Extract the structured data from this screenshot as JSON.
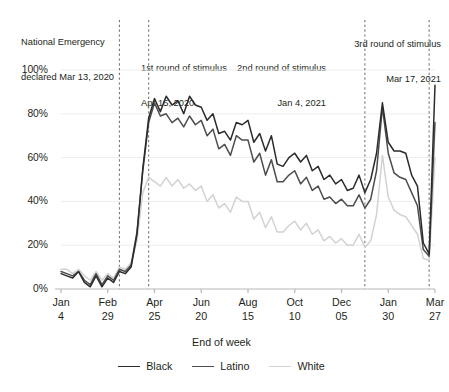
{
  "chart_data": {
    "type": "line",
    "title": "",
    "xlabel": "End of week",
    "ylabel": "",
    "ylim": [
      0,
      100
    ],
    "ytick_labels": [
      "100%",
      "80%",
      "60%",
      "40%",
      "20%",
      "0%"
    ],
    "ytick_values": [
      100,
      80,
      60,
      40,
      20,
      0
    ],
    "grid": true,
    "legend_position": "bottom",
    "xtick_labels": [
      {
        "month": "Jan",
        "day": "4"
      },
      {
        "month": "Feb",
        "day": "29"
      },
      {
        "month": "Apr",
        "day": "25"
      },
      {
        "month": "Jun",
        "day": "20"
      },
      {
        "month": "Aug",
        "day": "15"
      },
      {
        "month": "Oct",
        "day": "10"
      },
      {
        "month": "Dec",
        "day": "05"
      },
      {
        "month": "Jan",
        "day": "30"
      },
      {
        "month": "Mar",
        "day": "27"
      }
    ],
    "xtick_index": [
      0,
      8,
      16,
      24,
      32,
      40,
      48,
      56,
      64
    ],
    "x_count": 65,
    "series": [
      {
        "name": "Black",
        "color": "#2b2b2b",
        "values": [
          7,
          6,
          5,
          8,
          3,
          1,
          6,
          1,
          5,
          3,
          8,
          7,
          10,
          25,
          55,
          78,
          87,
          81,
          88,
          84,
          86,
          80,
          88,
          84,
          83,
          77,
          80,
          71,
          72,
          68,
          76,
          75,
          77,
          67,
          71,
          63,
          70,
          57,
          56,
          60,
          62,
          58,
          61,
          54,
          56,
          50,
          52,
          48,
          50,
          45,
          46,
          52,
          44,
          50,
          62,
          85,
          67,
          63,
          63,
          62,
          52,
          47,
          21,
          16,
          93
        ]
      },
      {
        "name": "Latino",
        "color": "#4d4d4d",
        "values": [
          8,
          7,
          6,
          8,
          4,
          2,
          7,
          2,
          6,
          4,
          9,
          8,
          11,
          26,
          54,
          76,
          85,
          79,
          80,
          76,
          78,
          74,
          79,
          75,
          77,
          70,
          73,
          64,
          66,
          61,
          70,
          68,
          68,
          58,
          62,
          52,
          59,
          49,
          49,
          52,
          54,
          48,
          51,
          45,
          47,
          41,
          42,
          39,
          41,
          38,
          38,
          43,
          37,
          41,
          54,
          83,
          62,
          53,
          51,
          50,
          44,
          38,
          18,
          15,
          76
        ]
      },
      {
        "name": "White",
        "color": "#d2d2d2",
        "values": [
          9,
          9,
          7,
          9,
          6,
          4,
          8,
          4,
          7,
          5,
          10,
          9,
          12,
          22,
          44,
          51,
          49,
          47,
          51,
          47,
          50,
          46,
          48,
          45,
          47,
          40,
          43,
          37,
          39,
          35,
          42,
          40,
          40,
          32,
          35,
          28,
          33,
          26,
          26,
          29,
          31,
          27,
          30,
          25,
          27,
          22,
          24,
          21,
          23,
          20,
          20,
          25,
          19,
          22,
          34,
          61,
          42,
          36,
          34,
          33,
          29,
          25,
          14,
          13,
          60
        ]
      }
    ],
    "annotations": [
      {
        "id": "national-emergency",
        "line1": "National Emergency",
        "line2": "declared Mar 13, 2020",
        "x_index": 10
      },
      {
        "id": "stimulus-1",
        "line1": "1st round of stimulus",
        "line2": "Apr 15, 2020",
        "x_index": 15
      },
      {
        "id": "stimulus-2",
        "line1": "2nd round of stimulus",
        "line2": "Jan 4, 2021",
        "x_index": 52
      },
      {
        "id": "stimulus-3",
        "line1": "3rd round of stimulus",
        "line2": "Mar 17, 2021",
        "x_index": 63
      }
    ]
  },
  "legend": {
    "items": [
      {
        "label": "Black",
        "color": "#2b2b2b"
      },
      {
        "label": "Latino",
        "color": "#4d4d4d"
      },
      {
        "label": "White",
        "color": "#d2d2d2"
      }
    ]
  }
}
